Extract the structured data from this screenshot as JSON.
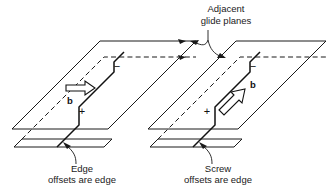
{
  "figure": {
    "width": 332,
    "height": 188,
    "background_color": "#ffffff",
    "line_color": "#1a1a1a",
    "arrow_fill_color": "#ffffff"
  },
  "labels": {
    "top": {
      "line1": "Adjacent",
      "line2": "glide planes"
    },
    "left_caption": {
      "line1": "Edge",
      "line2": "offsets are edge"
    },
    "right_caption": {
      "line1": "Screw",
      "line2": "offsets are edge"
    }
  },
  "units": [
    {
      "id": "left-unit",
      "caption_line1": "Edge",
      "caption_line2": "offsets are edge",
      "burgers_label": "b",
      "burgers_direction": "horizontal-right",
      "sign_positive": "+",
      "sign_negative": "−"
    },
    {
      "id": "right-unit",
      "caption_line1": "Screw",
      "caption_line2": "offsets are edge",
      "burgers_label": "b",
      "burgers_direction": "diagonal-up-right",
      "sign_positive": "+",
      "sign_negative": "−"
    }
  ]
}
